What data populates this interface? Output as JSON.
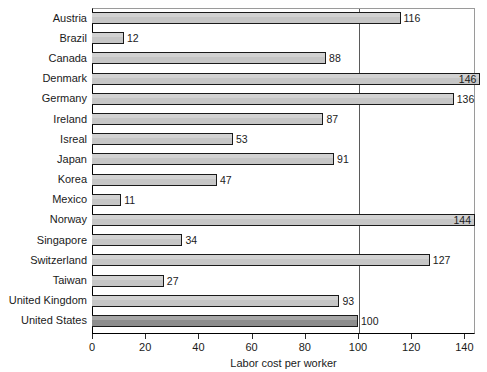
{
  "chart_data": {
    "type": "bar",
    "orientation": "horizontal",
    "title": "",
    "xlabel": "Labor cost per worker",
    "ylabel": "",
    "xlim": [
      0,
      144
    ],
    "xticks": [
      0,
      20,
      40,
      60,
      80,
      100,
      120,
      140
    ],
    "grid": false,
    "reference_line": 100,
    "highlight_category": "United States",
    "colors": {
      "bar_fill": "#c6c6c6",
      "bar_accent_fill": "#8d8d8d",
      "bar_border": "#1a1a1a",
      "reference_line": "#5a5a5a",
      "text": "#1a1a1a",
      "background": "#ffffff"
    },
    "categories": [
      "Austria",
      "Brazil",
      "Canada",
      "Denmark",
      "Germany",
      "Ireland",
      "Isreal",
      "Japan",
      "Korea",
      "Mexico",
      "Norway",
      "Singapore",
      "Switzerland",
      "Taiwan",
      "United Kingdom",
      "United States"
    ],
    "values": [
      116,
      12,
      88,
      146,
      136,
      87,
      53,
      91,
      47,
      11,
      144,
      34,
      127,
      27,
      93,
      100
    ],
    "bars": [
      {
        "category": "Austria",
        "value": 116,
        "label": "116",
        "label_inside": false,
        "accent": false
      },
      {
        "category": "Brazil",
        "value": 12,
        "label": "12",
        "label_inside": false,
        "accent": false
      },
      {
        "category": "Canada",
        "value": 88,
        "label": "88",
        "label_inside": false,
        "accent": false
      },
      {
        "category": "Denmark",
        "value": 146,
        "label": "146",
        "label_inside": true,
        "accent": false
      },
      {
        "category": "Germany",
        "value": 136,
        "label": "136",
        "label_inside": false,
        "accent": false
      },
      {
        "category": "Ireland",
        "value": 87,
        "label": "87",
        "label_inside": false,
        "accent": false
      },
      {
        "category": "Isreal",
        "value": 53,
        "label": "53",
        "label_inside": false,
        "accent": false
      },
      {
        "category": "Japan",
        "value": 91,
        "label": "91",
        "label_inside": false,
        "accent": false
      },
      {
        "category": "Korea",
        "value": 47,
        "label": "47",
        "label_inside": false,
        "accent": false
      },
      {
        "category": "Mexico",
        "value": 11,
        "label": "11",
        "label_inside": false,
        "accent": false
      },
      {
        "category": "Norway",
        "value": 144,
        "label": "144",
        "label_inside": true,
        "accent": false
      },
      {
        "category": "Singapore",
        "value": 34,
        "label": "34",
        "label_inside": false,
        "accent": false
      },
      {
        "category": "Switzerland",
        "value": 127,
        "label": "127",
        "label_inside": false,
        "accent": false
      },
      {
        "category": "Taiwan",
        "value": 27,
        "label": "27",
        "label_inside": false,
        "accent": false
      },
      {
        "category": "United Kingdom",
        "value": 93,
        "label": "93",
        "label_inside": false,
        "accent": false
      },
      {
        "category": "United States",
        "value": 100,
        "label": "100",
        "label_inside": false,
        "accent": true
      }
    ]
  }
}
